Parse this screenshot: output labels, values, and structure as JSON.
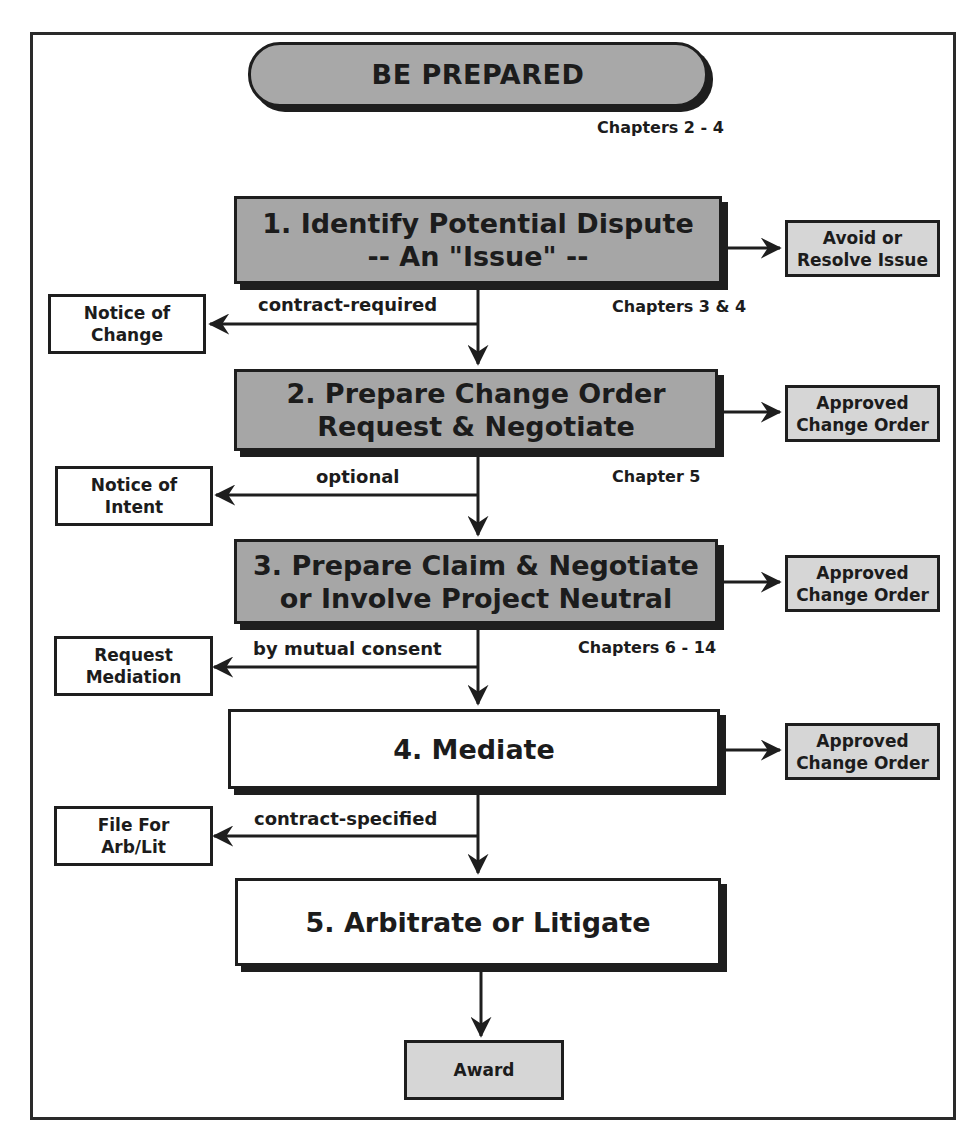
{
  "header": {
    "title": "BE PREPARED",
    "chapters": "Chapters 2 - 4"
  },
  "steps": [
    {
      "number": "1",
      "line1": "1. Identify Potential Dispute",
      "line2": "-- An \"Issue\" --",
      "style": "shaded",
      "chapters": "Chapters 3 & 4",
      "outcome": {
        "line1": "Avoid or",
        "line2": "Resolve Issue"
      },
      "branch": {
        "label": "contract-required",
        "target_line1": "Notice of",
        "target_line2": "Change"
      }
    },
    {
      "number": "2",
      "line1": "2. Prepare Change Order",
      "line2": "Request & Negotiate",
      "style": "shaded",
      "chapters": "Chapter 5",
      "outcome": {
        "line1": "Approved",
        "line2": "Change Order"
      },
      "branch": {
        "label": "optional",
        "target_line1": "Notice of",
        "target_line2": "Intent"
      }
    },
    {
      "number": "3",
      "line1": "3. Prepare Claim & Negotiate",
      "line2": "or Involve Project Neutral",
      "style": "shaded",
      "chapters": "Chapters 6 - 14",
      "outcome": {
        "line1": "Approved",
        "line2": "Change Order"
      },
      "branch": {
        "label": "by mutual consent",
        "target_line1": "Request",
        "target_line2": "Mediation"
      }
    },
    {
      "number": "4",
      "line1": "4. Mediate",
      "style": "plain",
      "outcome": {
        "line1": "Approved",
        "line2": "Change Order"
      },
      "branch": {
        "label": "contract-specified",
        "target_line1": "File For",
        "target_line2": "Arb/Lit"
      }
    },
    {
      "number": "5",
      "line1": "5. Arbitrate or Litigate",
      "style": "plain"
    }
  ],
  "final": {
    "label": "Award"
  },
  "colors": {
    "stroke": "#1e1e1e",
    "shaded_fill": "#a6a6a6",
    "outcome_fill": "#d6d6d6",
    "plain_fill": "#ffffff"
  }
}
